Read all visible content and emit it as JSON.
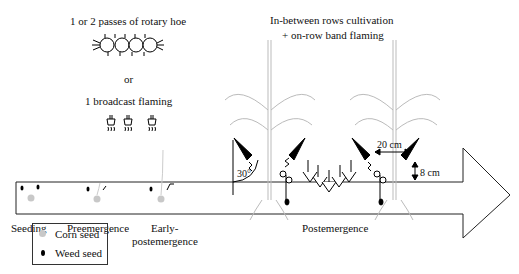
{
  "diagram": {
    "top_left": {
      "rotary_hoe_label": "1 or 2 passes of rotary hoe",
      "or_label": "or",
      "flaming_label": "1 broadcast flaming"
    },
    "top_right": {
      "line1": "In-between rows cultivation",
      "line2": "+ on-row band flaming"
    },
    "measurements": {
      "angle": "30°",
      "spacing": "20 cm",
      "height": "8 cm"
    },
    "stages": [
      {
        "label": "Seeding"
      },
      {
        "label": "Preemergence"
      },
      {
        "label": "Early-",
        "label2": "postemergence"
      },
      {
        "label": "Postemergence"
      }
    ],
    "legend": {
      "items": [
        {
          "label": "Corn seed",
          "color": "#c8c8c8"
        },
        {
          "label": "Weed seed",
          "color": "#000000"
        }
      ]
    }
  }
}
